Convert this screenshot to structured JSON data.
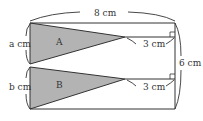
{
  "diagram": {
    "labels": {
      "top_width": "8 cm",
      "left_a": "a cm",
      "left_b": "b cm",
      "right_height": "6 cm",
      "segment_a": "3 cm",
      "segment_b": "3 cm",
      "triangle_a": "A",
      "triangle_b": "B"
    },
    "colors": {
      "fill": "#b3b3b3",
      "stroke": "#333333"
    }
  }
}
